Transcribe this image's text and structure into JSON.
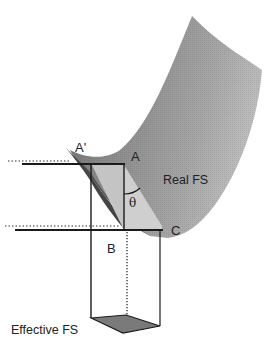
{
  "figure": {
    "type": "diagram",
    "labels": {
      "a_prime": "A'",
      "a": "A",
      "theta": "θ",
      "b": "B",
      "c": "C",
      "real_fs": "Real FS",
      "effective_fs": "Effective FS"
    },
    "colors": {
      "surface_dark": "#5a5a5a",
      "surface_mid": "#8c8c8c",
      "surface_light": "#b4b4b4",
      "face_light": "#c8c8c8",
      "line": "#1a1a1a",
      "base_fill": "#7a7a7a"
    }
  }
}
